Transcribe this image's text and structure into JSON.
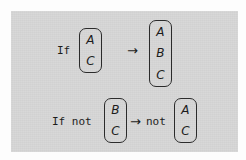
{
  "canvas": {
    "width": 246,
    "height": 160,
    "page_background": "#fdfdfd",
    "panel_background": "#d6d6d6",
    "ink_color": "#1c1c1c"
  },
  "diagram": {
    "type": "logic-inference-rule",
    "rows": [
      {
        "id": "row-affirm",
        "condition_label": "If",
        "premise_stack": [
          "A",
          "C"
        ],
        "operator": "→",
        "result_prefix": "",
        "result_stack": [
          "A",
          "B",
          "C"
        ]
      },
      {
        "id": "row-negate",
        "condition_label": "If not",
        "premise_stack": [
          "B",
          "C"
        ],
        "operator": "→",
        "result_prefix": "not",
        "result_stack": [
          "A",
          "C"
        ]
      }
    ]
  }
}
